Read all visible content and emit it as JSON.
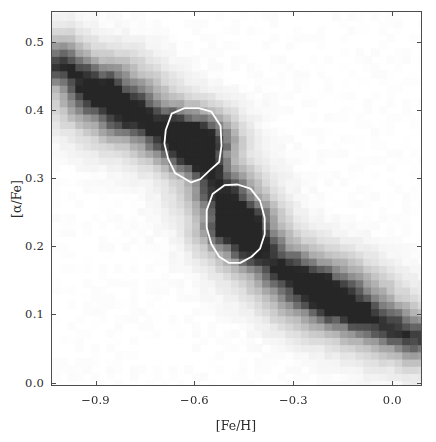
{
  "figure": {
    "background": "#ffffff",
    "frame_color": "#4d4d4d",
    "text_color": "#2b2b2b"
  },
  "chart_data": {
    "type": "heatmap",
    "title": "",
    "subtitle": "",
    "xlabel": "[Fe/H]",
    "ylabel": "[α/Fe]",
    "xlim": [
      -1.035,
      0.09
    ],
    "ylim": [
      -0.005,
      0.545
    ],
    "xticks": [
      -0.9,
      -0.6,
      -0.3,
      0.0
    ],
    "xticklabels": [
      "−0.9",
      "−0.6",
      "−0.3",
      "0.0"
    ],
    "yticks": [
      0.0,
      0.1,
      0.2,
      0.3,
      0.4,
      0.5
    ],
    "yticklabels": [
      "0.0",
      "0.1",
      "0.2",
      "0.3",
      "0.4",
      "0.5"
    ],
    "grid": false,
    "legend": null,
    "colormap": "gray_reversed",
    "colormap_low_color": "#ffffff",
    "colormap_high_color": "#262626",
    "cell_width_dex": 0.0236,
    "cell_height_dex": 0.01057,
    "nx": 48,
    "ny": 52,
    "zmin": 0.0,
    "zmax": 1.0,
    "density_model": {
      "ridge_points": [
        [
          -1.0,
          0.47
        ],
        [
          -0.9,
          0.43
        ],
        [
          -0.8,
          0.4
        ],
        [
          -0.7,
          0.375
        ],
        [
          -0.6,
          0.35
        ],
        [
          -0.52,
          0.285
        ],
        [
          -0.47,
          0.235
        ],
        [
          -0.4,
          0.195
        ],
        [
          -0.33,
          0.17
        ],
        [
          -0.25,
          0.145
        ],
        [
          -0.17,
          0.12
        ],
        [
          -0.08,
          0.098
        ],
        [
          0.0,
          0.082
        ],
        [
          0.06,
          0.07
        ]
      ],
      "ridge_sigma": 0.052,
      "ridge_amplitude": 0.62,
      "envelope_sigma": 0.105,
      "envelope_amplitude": 0.3,
      "blobs": [
        {
          "name": "high-alpha-peak",
          "x": -0.6,
          "y": 0.355,
          "sx": 0.07,
          "sy": 0.03,
          "amp": 0.78
        },
        {
          "name": "low-alpha-peak",
          "x": -0.47,
          "y": 0.235,
          "sx": 0.065,
          "sy": 0.029,
          "amp": 0.82
        },
        {
          "name": "metal-poor-wing",
          "x": -0.84,
          "y": 0.42,
          "sx": 0.095,
          "sy": 0.04,
          "amp": 0.4
        },
        {
          "name": "metal-rich-tail",
          "x": -0.2,
          "y": 0.135,
          "sx": 0.11,
          "sy": 0.035,
          "amp": 0.46
        }
      ],
      "noise_amplitude": 0.085,
      "noise_seed": 20231
    },
    "contours": [
      {
        "name": "high-alpha-contour",
        "stroke": "#ffffff",
        "stroke_width": 1.8,
        "closed": true,
        "vertices_data": [
          [
            -0.69,
            0.372
          ],
          [
            -0.672,
            0.396
          ],
          [
            -0.633,
            0.404
          ],
          [
            -0.59,
            0.404
          ],
          [
            -0.552,
            0.399
          ],
          [
            -0.524,
            0.378
          ],
          [
            -0.521,
            0.349
          ],
          [
            -0.528,
            0.325
          ],
          [
            -0.556,
            0.313
          ],
          [
            -0.585,
            0.3
          ],
          [
            -0.613,
            0.295
          ],
          [
            -0.637,
            0.302
          ],
          [
            -0.662,
            0.309
          ],
          [
            -0.683,
            0.33
          ],
          [
            -0.694,
            0.352
          ]
        ]
      },
      {
        "name": "low-alpha-contour",
        "stroke": "#ffffff",
        "stroke_width": 1.8,
        "closed": true,
        "vertices_data": [
          [
            -0.566,
            0.254
          ],
          [
            -0.548,
            0.278
          ],
          [
            -0.512,
            0.291
          ],
          [
            -0.472,
            0.292
          ],
          [
            -0.433,
            0.286
          ],
          [
            -0.404,
            0.268
          ],
          [
            -0.39,
            0.243
          ],
          [
            -0.39,
            0.219
          ],
          [
            -0.404,
            0.198
          ],
          [
            -0.43,
            0.186
          ],
          [
            -0.464,
            0.177
          ],
          [
            -0.498,
            0.177
          ],
          [
            -0.528,
            0.186
          ],
          [
            -0.552,
            0.205
          ],
          [
            -0.566,
            0.229
          ]
        ]
      }
    ]
  }
}
